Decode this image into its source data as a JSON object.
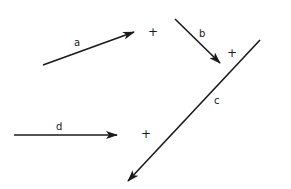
{
  "diagram": {
    "type": "vector-diagram",
    "stroke_color": "#1a1a1a",
    "background": "#ffffff",
    "vectors": [
      {
        "id": "a",
        "label": "a",
        "from": [
          43,
          65
        ],
        "to": [
          134,
          32
        ],
        "arrowhead": "end",
        "label_pos": [
          74,
          38
        ]
      },
      {
        "id": "b",
        "label": "b",
        "from": [
          175,
          19
        ],
        "to": [
          220,
          63
        ],
        "arrowhead": "end",
        "label_pos": [
          199,
          29
        ]
      },
      {
        "id": "c",
        "label": "c",
        "from": [
          260,
          40
        ],
        "to": [
          128,
          181
        ],
        "arrowhead": "end",
        "label_pos": [
          214,
          96
        ]
      },
      {
        "id": "d",
        "label": "d",
        "from": [
          14,
          135
        ],
        "to": [
          117,
          135
        ],
        "arrowhead": "end",
        "label_pos": [
          56,
          122
        ]
      }
    ],
    "plus_markers": [
      {
        "id": "plus-a",
        "symbol": "+",
        "pos": [
          148,
          26
        ]
      },
      {
        "id": "plus-b",
        "symbol": "+",
        "pos": [
          227,
          47
        ]
      },
      {
        "id": "plus-d",
        "symbol": "+",
        "pos": [
          141,
          128
        ]
      }
    ]
  }
}
